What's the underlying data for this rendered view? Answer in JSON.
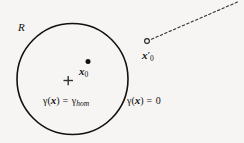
{
  "figure": {
    "background_color": "#f6f5f3",
    "stroke_color": "#111111",
    "region": {
      "label": "R",
      "shape": "circle",
      "center": [
        72,
        79
      ],
      "radius": 56
    },
    "markers": {
      "center_cross": {
        "symbol": "+",
        "position": [
          68,
          80
        ]
      },
      "interior_point": {
        "symbol": "filled-dot",
        "position": [
          88,
          62
        ]
      },
      "exterior_point": {
        "symbol": "open-circle",
        "position": [
          147,
          41
        ]
      }
    },
    "dashed_ray": {
      "from": [
        151,
        40
      ],
      "to": [
        238,
        2
      ]
    },
    "labels": {
      "region": "R",
      "interior_point_x": "x",
      "interior_point_sub": "0",
      "exterior_point_x": "x",
      "exterior_point_prime": "′",
      "exterior_point_sub": "0",
      "gamma": "γ",
      "open_paren": "(",
      "close_paren": ")",
      "bold_x": "x",
      "equals": " = ",
      "gamma_hom_sub": "hom",
      "zero": "0"
    }
  }
}
